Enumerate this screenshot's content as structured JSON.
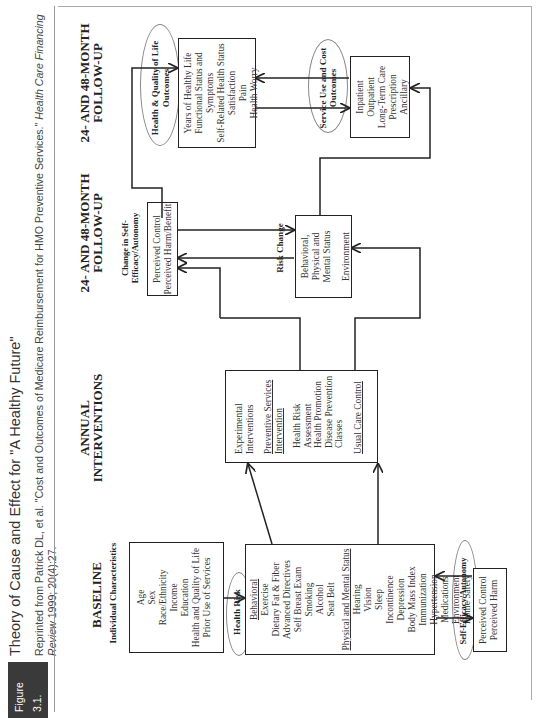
{
  "figure": {
    "tag": "Figure 3.1.",
    "source_tag": "SOURCE:",
    "title": "Theory of Cause and Effect for \"A Healthy Future\"",
    "source_text": "Reprinted from Patrick DL, et al. \"Cost and Outcomes of Medicare Reimbursement for HMO Preventive Services.\"",
    "source_journal": "Health Care Financing Review",
    "source_citation": "1999; 20(4):27."
  },
  "columns": [
    {
      "label": "BASELINE"
    },
    {
      "label": "ANNUAL INTERVENTIONS"
    },
    {
      "label": "24- AND 48-MONTH FOLLOW-UP"
    },
    {
      "label": "24- AND 48-MONTH FOLLOW-UP"
    }
  ],
  "nodes": {
    "individual": {
      "heading": "Individual Characteristics",
      "items": [
        "Age",
        "Sex",
        "Race/Ethnicity",
        "Income",
        "Education",
        "Health and Quality of Life",
        "Prior Use of Services"
      ]
    },
    "health_risk": {
      "heading": "Health Risk",
      "section1": "Behavioral",
      "items1": [
        "Exercise",
        "Dietary Fat & Fiber",
        "Advanced Directives",
        "Self Breast Exam",
        "Smoking",
        "Alcohol",
        "Seat Belt"
      ],
      "section2": "Physical and Mental Status",
      "items2": [
        "Hearing",
        "Vision",
        "Sleep",
        "Incontinence",
        "Depression",
        "Body Mass Index",
        "Immunization",
        "Hypertension",
        "Medications",
        "Environment",
        "Home Safety"
      ]
    },
    "self_efficacy": {
      "heading": "Self-Efficacy/Autonomy",
      "items": [
        "Perceived Control",
        "Perceived Harm"
      ]
    },
    "interventions": {
      "line1": "Experimental Interventions",
      "section": "Preventive Services Intervention",
      "items": [
        "Health Risk Assessment",
        "Health Promotion",
        "Disease Prevention Classes"
      ],
      "control": "Usual Care Control"
    },
    "change_efficacy": {
      "heading": "Change in Self-Efficacy/Autonomy",
      "items": [
        "Perceived Control",
        "Perceived Harm/Benefit"
      ]
    },
    "risk_change": {
      "heading": "Risk Change",
      "items": [
        "Behavioral, Physical and Mental Status",
        "Environment"
      ]
    },
    "health_outcomes": {
      "heading": "Health & Quality of Life Outcomes",
      "items": [
        "Years of Healthy Life",
        "Functional Status and Symptoms",
        "Self-Related Health Status",
        "Satisfaction",
        "Pain",
        "Health Worry"
      ]
    },
    "service_outcomes": {
      "heading": "Service Use and Cost Outcomes",
      "items": [
        "Inpatient",
        "Outpatient",
        "Long-Term Care",
        "Prescription",
        "Ancillary"
      ]
    }
  }
}
